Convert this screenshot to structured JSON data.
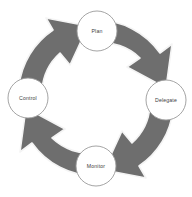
{
  "diagram": {
    "type": "circular-cycle",
    "direction": "clockwise",
    "stage_count": 4,
    "colors": {
      "background": "#ffffff",
      "band_fill": "#6e6e6e",
      "band_edge_highlight": "#f2f2f2",
      "band_edge_shadow": "#5a5a5a",
      "node_fill": "#ffffff",
      "node_stroke": "#9a9a9a",
      "label_text": "#3d3d3d"
    },
    "geometry": {
      "center_x": 96,
      "center_y": 98,
      "outer_radius": 78,
      "inner_radius": 55,
      "node_radius": 20
    },
    "stages": [
      {
        "id": "plan",
        "label": "Plan",
        "position": "top",
        "cx": 97,
        "cy": 31,
        "order": 1
      },
      {
        "id": "delegate",
        "label": "Delegate",
        "position": "right",
        "cx": 166,
        "cy": 100,
        "order": 2
      },
      {
        "id": "monitor",
        "label": "Monitor",
        "position": "bottom",
        "cx": 96,
        "cy": 166,
        "order": 3
      },
      {
        "id": "control",
        "label": "Control",
        "position": "left",
        "cx": 28,
        "cy": 98,
        "order": 4
      }
    ],
    "arrows": [
      {
        "id": "arrow-plan-to-delegate",
        "from": "plan",
        "to": "delegate",
        "quadrant": "top-right",
        "points_toward": "down-right"
      },
      {
        "id": "arrow-delegate-to-monitor",
        "from": "delegate",
        "to": "monitor",
        "quadrant": "bottom-right",
        "points_toward": "down-left"
      },
      {
        "id": "arrow-monitor-to-control",
        "from": "monitor",
        "to": "control",
        "quadrant": "bottom-left",
        "points_toward": "up-left"
      },
      {
        "id": "arrow-control-to-plan",
        "from": "control",
        "to": "plan",
        "quadrant": "top-left",
        "points_toward": "up-right"
      }
    ]
  }
}
